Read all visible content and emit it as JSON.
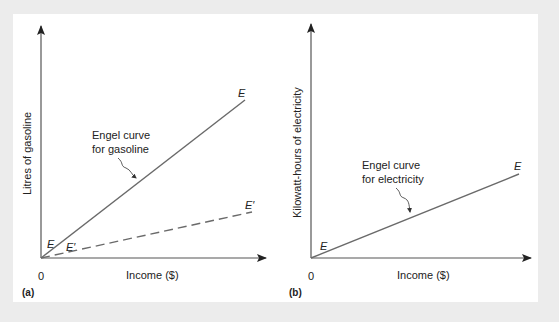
{
  "colors": {
    "background": "#ececec",
    "panel": "#ffffff",
    "line": "#6a6a6a",
    "axis": "#555555",
    "text": "#222222"
  },
  "panels": [
    {
      "id": "a",
      "panel_label": "(a)",
      "y_axis_label": "Litres of gasoline",
      "x_axis_label": "Income ($)",
      "origin_label": "0",
      "annotation_line1": "Engel curve",
      "annotation_line2": "for gasoline",
      "solid_curve": {
        "start_label": "E",
        "end_label": "E"
      },
      "dashed_curve": {
        "start_label": "E′",
        "end_label": "E′"
      }
    },
    {
      "id": "b",
      "panel_label": "(b)",
      "y_axis_label": "Kilowatt-hours of electricity",
      "x_axis_label": "Income ($)",
      "origin_label": "0",
      "annotation_line1": "Engel curve",
      "annotation_line2": "for electricity",
      "solid_curve": {
        "start_label": "E",
        "end_label": "E"
      }
    }
  ]
}
